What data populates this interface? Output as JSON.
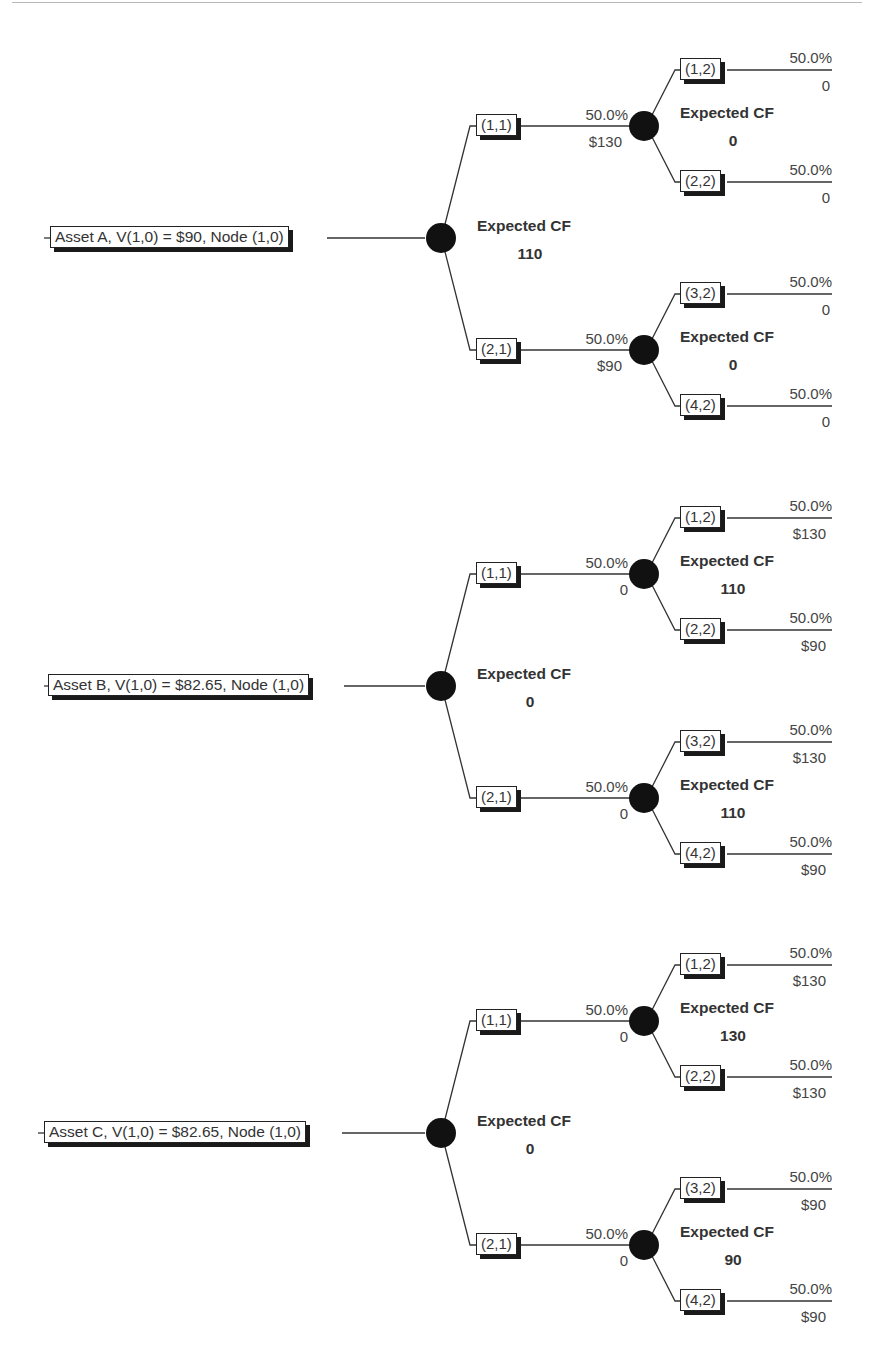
{
  "trees": [
    {
      "root_label": "Asset A, V(1,0) = $90, Node (1,0)",
      "expected_cf_label": "Expected CF",
      "expected_cf": "110",
      "branches": [
        {
          "node": "(1,1)",
          "prob": "50.0%",
          "cf": "$130",
          "expected_cf_label": "Expected CF",
          "expected_cf": "0",
          "leaves": [
            {
              "node": "(1,2)",
              "prob": "50.0%",
              "cf": "0"
            },
            {
              "node": "(2,2)",
              "prob": "50.0%",
              "cf": "0"
            }
          ]
        },
        {
          "node": "(2,1)",
          "prob": "50.0%",
          "cf": "$90",
          "expected_cf_label": "Expected CF",
          "expected_cf": "0",
          "leaves": [
            {
              "node": "(3,2)",
              "prob": "50.0%",
              "cf": "0"
            },
            {
              "node": "(4,2)",
              "prob": "50.0%",
              "cf": "0"
            }
          ]
        }
      ]
    },
    {
      "root_label": "Asset B, V(1,0) = $82.65, Node (1,0)",
      "expected_cf_label": "Expected CF",
      "expected_cf": "0",
      "branches": [
        {
          "node": "(1,1)",
          "prob": "50.0%",
          "cf": "0",
          "expected_cf_label": "Expected CF",
          "expected_cf": "110",
          "leaves": [
            {
              "node": "(1,2)",
              "prob": "50.0%",
              "cf": "$130"
            },
            {
              "node": "(2,2)",
              "prob": "50.0%",
              "cf": "$90"
            }
          ]
        },
        {
          "node": "(2,1)",
          "prob": "50.0%",
          "cf": "0",
          "expected_cf_label": "Expected CF",
          "expected_cf": "110",
          "leaves": [
            {
              "node": "(3,2)",
              "prob": "50.0%",
              "cf": "$130"
            },
            {
              "node": "(4,2)",
              "prob": "50.0%",
              "cf": "$90"
            }
          ]
        }
      ]
    },
    {
      "root_label": "Asset C, V(1,0) = $82.65, Node (1,0)",
      "expected_cf_label": "Expected CF",
      "expected_cf": "0",
      "branches": [
        {
          "node": "(1,1)",
          "prob": "50.0%",
          "cf": "0",
          "expected_cf_label": "Expected CF",
          "expected_cf": "130",
          "leaves": [
            {
              "node": "(1,2)",
              "prob": "50.0%",
              "cf": "$130"
            },
            {
              "node": "(2,2)",
              "prob": "50.0%",
              "cf": "$130"
            }
          ]
        },
        {
          "node": "(2,1)",
          "prob": "50.0%",
          "cf": "0",
          "expected_cf_label": "Expected CF",
          "expected_cf": "90",
          "leaves": [
            {
              "node": "(3,2)",
              "prob": "50.0%",
              "cf": "$90"
            },
            {
              "node": "(4,2)",
              "prob": "50.0%",
              "cf": "$90"
            }
          ]
        }
      ]
    }
  ]
}
